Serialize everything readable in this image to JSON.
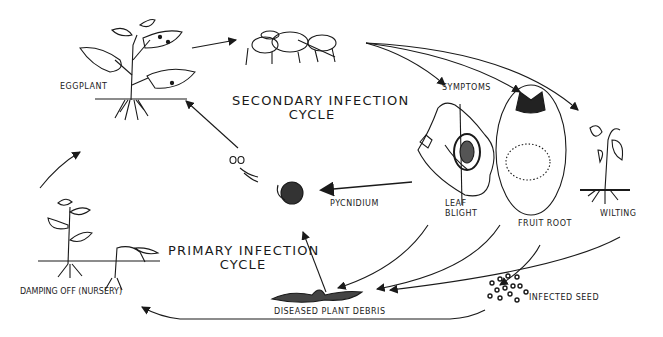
{
  "diagram": {
    "title_secondary": "SECONDARY INFECTION",
    "title_secondary_2": "CYCLE",
    "title_primary": "PRIMARY INFECTION",
    "title_primary_2": "CYCLE",
    "labels": {
      "eggplant": "EGGPLANT",
      "symptoms": "SYMPTOMS",
      "pycnidium": "PYCNIDIUM",
      "leaf_blight_1": "LEAF",
      "leaf_blight_2": "BLIGHT",
      "fruit_root": "FRUIT ROOT",
      "wilting": "WILTING",
      "damping_off": "DAMPING OFF (NURSERY)",
      "diseased_debris": "DISEASED PLANT DEBRIS",
      "infected_seed": "INFECTED SEED"
    },
    "colors": {
      "ink": "#1a1a1a",
      "background": "#ffffff"
    }
  }
}
